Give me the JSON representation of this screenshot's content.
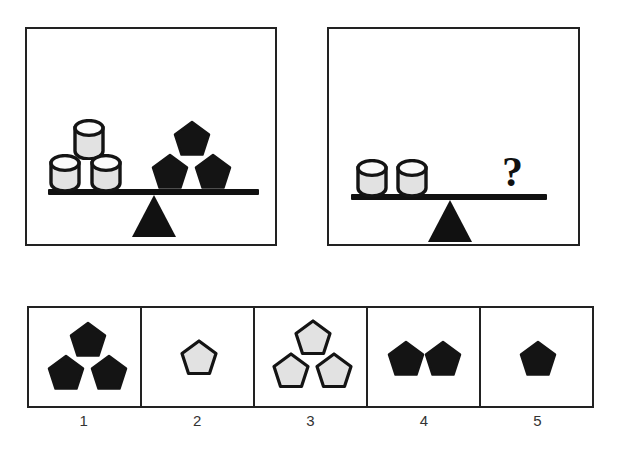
{
  "puzzle": {
    "type": "balance-scale-analogy",
    "colors": {
      "ink": "#222222",
      "shape_fill_dark": "#141414",
      "shape_fill_light": "#e2e2e2",
      "background": "#ffffff"
    },
    "panels": [
      {
        "id": "panel-left",
        "name": "given-balance",
        "left_pan": {
          "object": "cylinder",
          "count": 3,
          "fill": "#e2e2e2",
          "arrangement": "two-bottom-one-top"
        },
        "right_pan": {
          "object": "pentagon",
          "count": 3,
          "fill": "#141414",
          "arrangement": "two-bottom-one-top"
        },
        "state": "balanced"
      },
      {
        "id": "panel-right",
        "name": "question-balance",
        "left_pan": {
          "object": "cylinder",
          "count": 2,
          "fill": "#e2e2e2",
          "arrangement": "side-by-side"
        },
        "right_pan": {
          "object": "question-mark",
          "count": 1,
          "symbol": "?"
        },
        "state": "balanced"
      }
    ],
    "answer_options": [
      {
        "label": "1",
        "object": "pentagon",
        "count": 3,
        "fill": "#141414",
        "outline": "#141414",
        "arrangement": "two-bottom-one-top"
      },
      {
        "label": "2",
        "object": "pentagon",
        "count": 1,
        "fill": "#e2e2e2",
        "outline": "#141414",
        "arrangement": "single"
      },
      {
        "label": "3",
        "object": "pentagon",
        "count": 3,
        "fill": "#e2e2e2",
        "outline": "#141414",
        "arrangement": "two-bottom-one-top"
      },
      {
        "label": "4",
        "object": "pentagon",
        "count": 2,
        "fill": "#141414",
        "outline": "#141414",
        "arrangement": "side-by-side"
      },
      {
        "label": "5",
        "object": "pentagon",
        "count": 1,
        "fill": "#141414",
        "outline": "#141414",
        "arrangement": "single"
      }
    ]
  }
}
